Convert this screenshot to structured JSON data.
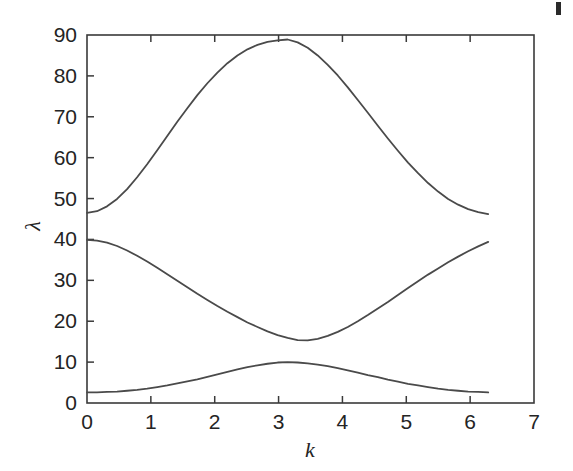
{
  "figure": {
    "name": "phonon-dispersion-plot",
    "background_color": "#ffffff",
    "line_color": "#4a4a4a",
    "axis_color": "#3a3a3a",
    "text_color": "#242424"
  },
  "artifact": {
    "label": "scan-speck"
  },
  "chart_data": {
    "type": "line",
    "title": "",
    "subtitle": "",
    "xlabel": "k",
    "ylabel": "λ",
    "xlim": [
      0,
      7
    ],
    "ylim": [
      0,
      90
    ],
    "xticks": [
      0,
      1,
      2,
      3,
      4,
      5,
      6,
      7
    ],
    "xticklabels": [
      "0",
      "1",
      "2",
      "3",
      "4",
      "5",
      "6",
      "7"
    ],
    "yticks": [
      0,
      10,
      20,
      30,
      40,
      50,
      60,
      70,
      80,
      90
    ],
    "yticklabels": [
      "0",
      "10",
      "20",
      "30",
      "40",
      "50",
      "60",
      "70",
      "80",
      "90"
    ],
    "grid": false,
    "legend": null,
    "legend_position": "none",
    "annotations": [],
    "x": [
      0.0,
      0.157,
      0.314,
      0.471,
      0.628,
      0.785,
      0.942,
      1.1,
      1.257,
      1.414,
      1.571,
      1.728,
      1.885,
      2.042,
      2.199,
      2.356,
      2.513,
      2.67,
      2.827,
      2.985,
      3.142,
      3.299,
      3.456,
      3.613,
      3.77,
      3.927,
      4.084,
      4.241,
      4.398,
      4.555,
      4.712,
      4.869,
      5.027,
      5.184,
      5.341,
      5.498,
      5.655,
      5.812,
      5.969,
      6.126,
      6.283
    ],
    "series": [
      {
        "name": "branch-3-upper",
        "values": [
          46.5,
          46.9,
          48.1,
          49.9,
          52.3,
          55.2,
          58.4,
          61.8,
          65.3,
          68.8,
          72.1,
          75.3,
          78.2,
          80.8,
          83.1,
          85.0,
          86.5,
          87.6,
          88.3,
          88.7,
          88.9,
          88.2,
          86.9,
          85.0,
          82.7,
          80.1,
          77.2,
          74.1,
          71.0,
          67.8,
          64.7,
          61.7,
          58.8,
          56.2,
          53.8,
          51.7,
          49.9,
          48.5,
          47.4,
          46.7,
          46.2
        ]
      },
      {
        "name": "branch-2-middle",
        "values": [
          39.9,
          39.7,
          39.2,
          38.4,
          37.3,
          36.0,
          34.6,
          33.1,
          31.5,
          29.9,
          28.3,
          26.7,
          25.2,
          23.7,
          22.3,
          21.0,
          19.7,
          18.6,
          17.5,
          16.6,
          15.9,
          15.4,
          15.3,
          15.7,
          16.4,
          17.4,
          18.6,
          20.0,
          21.5,
          23.1,
          24.7,
          26.4,
          28.1,
          29.8,
          31.4,
          32.9,
          34.4,
          35.8,
          37.1,
          38.3,
          39.4
        ]
      },
      {
        "name": "branch-1-lower",
        "values": [
          2.6,
          2.6,
          2.7,
          2.8,
          3.0,
          3.2,
          3.5,
          3.9,
          4.3,
          4.8,
          5.3,
          5.8,
          6.4,
          7.0,
          7.6,
          8.2,
          8.8,
          9.2,
          9.6,
          9.9,
          10.0,
          9.9,
          9.7,
          9.4,
          9.0,
          8.5,
          8.0,
          7.4,
          6.8,
          6.3,
          5.7,
          5.2,
          4.7,
          4.3,
          3.9,
          3.5,
          3.2,
          3.0,
          2.8,
          2.7,
          2.6
        ]
      }
    ]
  }
}
